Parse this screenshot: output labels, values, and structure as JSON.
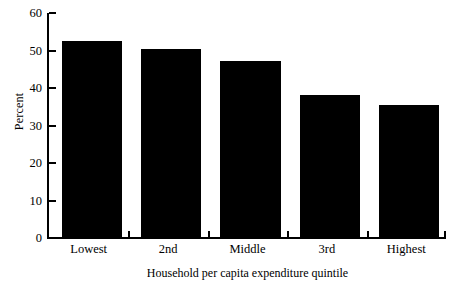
{
  "chart_data": {
    "type": "bar",
    "title": "",
    "subtitle": "",
    "categories": [
      "Lowest",
      "2nd",
      "Middle",
      "3rd",
      "Highest"
    ],
    "values": [
      52.5,
      50.3,
      47.2,
      38.1,
      35.5
    ],
    "xlabel": "Household per capita expenditure quintile",
    "ylabel": "Percent",
    "ylim": [
      0,
      60
    ],
    "ytick_labels": [
      "0",
      "10",
      "20",
      "30",
      "40",
      "50",
      "60"
    ],
    "ytick_values": [
      0,
      10,
      20,
      30,
      40,
      50,
      60
    ],
    "grid": false,
    "legend": null,
    "bar_color": "#000000",
    "background_color": "#ffffff",
    "axis_color": "#000000"
  }
}
